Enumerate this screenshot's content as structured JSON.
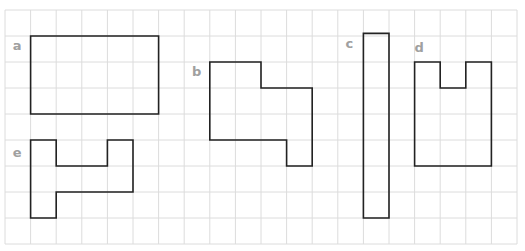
{
  "grid": {
    "origin_x": 5,
    "origin_y": 10,
    "cell_w": 25.6,
    "cell_h": 26.0,
    "cols": 20,
    "rows": 9,
    "line_color": "#dcdcdc"
  },
  "style": {
    "outline_color": "#222222",
    "label_color": "#a0a0a0"
  },
  "figures": [
    {
      "label": "a",
      "label_pos": [
        0.3,
        1.55
      ],
      "points": [
        [
          1,
          1
        ],
        [
          6,
          1
        ],
        [
          6,
          4
        ],
        [
          1,
          4
        ]
      ]
    },
    {
      "label": "b",
      "label_pos": [
        7.3,
        2.55
      ],
      "points": [
        [
          8,
          2
        ],
        [
          10,
          2
        ],
        [
          10,
          3
        ],
        [
          12,
          3
        ],
        [
          12,
          6
        ],
        [
          11,
          6
        ],
        [
          11,
          5
        ],
        [
          8,
          5
        ]
      ]
    },
    {
      "label": "c",
      "label_pos": [
        13.3,
        1.45
      ],
      "points": [
        [
          14,
          0.9
        ],
        [
          15,
          0.9
        ],
        [
          15,
          8
        ],
        [
          14,
          8
        ]
      ]
    },
    {
      "label": "d",
      "label_pos": [
        16.0,
        1.6
      ],
      "points": [
        [
          16,
          2
        ],
        [
          17,
          2
        ],
        [
          17,
          3
        ],
        [
          18,
          3
        ],
        [
          18,
          2
        ],
        [
          19,
          2
        ],
        [
          19,
          6
        ],
        [
          16,
          6
        ]
      ]
    },
    {
      "label": "e",
      "label_pos": [
        0.3,
        5.65
      ],
      "points": [
        [
          1,
          5
        ],
        [
          2,
          5
        ],
        [
          2,
          6
        ],
        [
          4,
          6
        ],
        [
          4,
          5
        ],
        [
          5,
          5
        ],
        [
          5,
          7
        ],
        [
          2,
          7
        ],
        [
          2,
          8
        ],
        [
          1,
          8
        ]
      ]
    }
  ]
}
